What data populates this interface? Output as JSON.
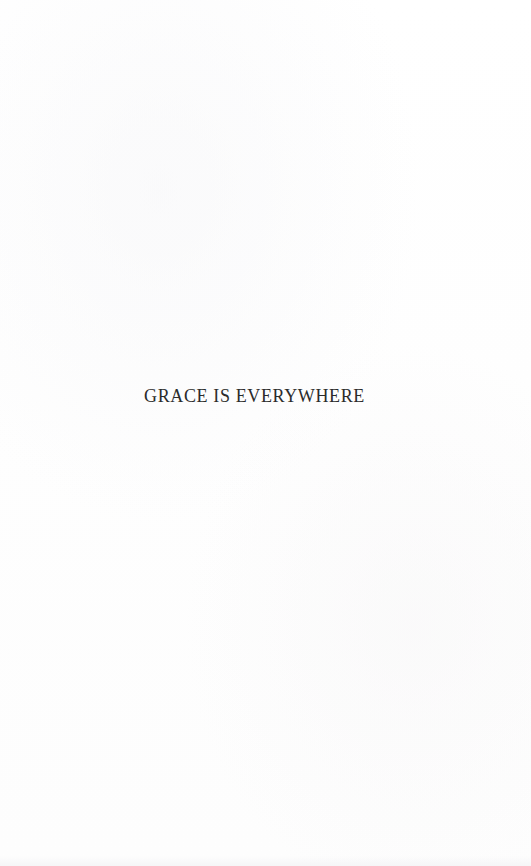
{
  "page": {
    "kind": "book-section-title-page",
    "background_color": "#fefefe",
    "ink_color": "#2b2b2b",
    "title": "GRACE IS EVERYWHERE"
  }
}
